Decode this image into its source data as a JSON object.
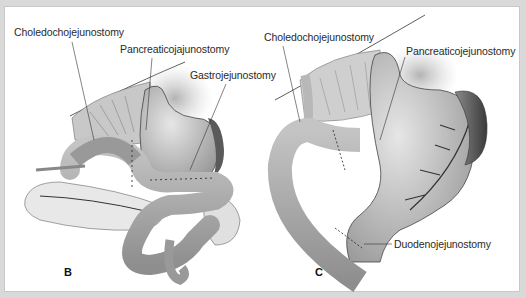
{
  "figure": {
    "panels": [
      {
        "id": "B",
        "letter": "B",
        "labels": {
          "choledocho": "Choledochojejunostomy",
          "pancreatico": "Pancreaticojajunostomy",
          "gastro": "Gastrojejunostomy"
        }
      },
      {
        "id": "C",
        "letter": "C",
        "labels": {
          "choledocho": "Choledochojejunostomy",
          "pancreatico": "Pancreaticojejunostomy",
          "duodeno": "Duodenojejunostomy"
        }
      }
    ],
    "colors": {
      "background_frame": "#d9d9d9",
      "panel": "#ffffff",
      "organ_light": "#d0d0d0",
      "organ_mid": "#a8a8a8",
      "organ_dark": "#5a5a5a",
      "line": "#333333"
    }
  }
}
